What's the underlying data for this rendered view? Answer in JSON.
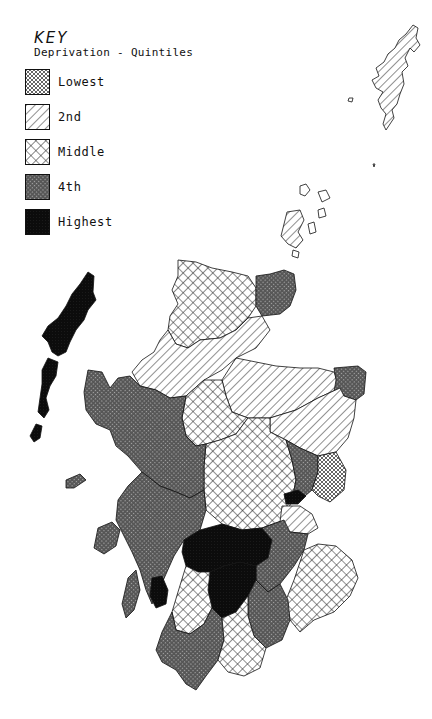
{
  "map": {
    "subject": "Scotland",
    "key": {
      "title": "KEY",
      "subtitle": "Deprivation - Quintiles",
      "items": [
        {
          "label": "Lowest",
          "pattern": "fine-diagonal-crosshatch",
          "shade": "#b8b8b8"
        },
        {
          "label": "2nd",
          "pattern": "diagonal-lines",
          "shade": "#e6e6e6"
        },
        {
          "label": "Middle",
          "pattern": "open-crosshatch",
          "shade": "#cfcfcf"
        },
        {
          "label": "4th",
          "pattern": "dense-crosshatch",
          "shade": "#6a6a6a"
        },
        {
          "label": "Highest",
          "pattern": "solid-dark",
          "shade": "#101010"
        }
      ]
    },
    "regions": [
      {
        "name": "Shetland",
        "quintile": "2nd"
      },
      {
        "name": "Orkney",
        "quintile": "2nd"
      },
      {
        "name": "Western Isles",
        "quintile": "Highest"
      },
      {
        "name": "North coast (Sutherland)",
        "quintile": "Middle"
      },
      {
        "name": "Caithness",
        "quintile": "4th"
      },
      {
        "name": "Ross and Cromarty",
        "quintile": "2nd"
      },
      {
        "name": "Skye and Lochalsh / West Highlands",
        "quintile": "4th"
      },
      {
        "name": "Inverness / Badenoch",
        "quintile": "Middle"
      },
      {
        "name": "Moray / Banff",
        "quintile": "2nd"
      },
      {
        "name": "Buchan",
        "quintile": "4th"
      },
      {
        "name": "Gordon / Kincardine",
        "quintile": "2nd"
      },
      {
        "name": "Perth and Kinross",
        "quintile": "Middle"
      },
      {
        "name": "Angus",
        "quintile": "4th"
      },
      {
        "name": "Dundee",
        "quintile": "Highest"
      },
      {
        "name": "Fife",
        "quintile": "2nd"
      },
      {
        "name": "Argyll",
        "quintile": "4th"
      },
      {
        "name": "Islay",
        "quintile": "Highest"
      },
      {
        "name": "Glasgow / Clydeside",
        "quintile": "Highest"
      },
      {
        "name": "Lanark",
        "quintile": "4th"
      },
      {
        "name": "Borders",
        "quintile": "Middle"
      },
      {
        "name": "Ayrshire",
        "quintile": "Highest"
      },
      {
        "name": "Dumfries and Galloway west",
        "quintile": "4th"
      },
      {
        "name": "Dumfries and Galloway east",
        "quintile": "Middle"
      }
    ]
  }
}
